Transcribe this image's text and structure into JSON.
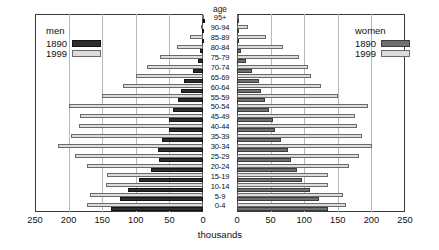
{
  "chart_data": {
    "type": "bar",
    "subtype": "population-pyramid",
    "title": "",
    "xlabel": "thousands",
    "ylabel": "age",
    "axis_title_center": "age",
    "grid": true,
    "xlim_left": [
      250,
      0
    ],
    "xlim_right": [
      0,
      250
    ],
    "xticks": [
      250,
      200,
      150,
      100,
      50,
      0
    ],
    "xticks_right": [
      0,
      50,
      100,
      150,
      200,
      250
    ],
    "categories": [
      "95+",
      "90-94",
      "85-89",
      "80-84",
      "75-79",
      "70-74",
      "65-69",
      "60-64",
      "55-59",
      "50-54",
      "45-49",
      "40-44",
      "35-39",
      "30-34",
      "25-29",
      "20-24",
      "15-19",
      "10-14",
      "5-9",
      "0-4"
    ],
    "series": [
      {
        "name": "men 1890",
        "side": "left",
        "year": "1890",
        "color": "#2e2e2e",
        "values": [
          0,
          1,
          2,
          4,
          7,
          15,
          28,
          32,
          37,
          45,
          50,
          50,
          61,
          67,
          66,
          78,
          95,
          112,
          124,
          137
        ]
      },
      {
        "name": "men 1999",
        "side": "left",
        "year": "1999",
        "color": "#dcdcdc",
        "values": [
          1,
          3,
          19,
          39,
          64,
          84,
          100,
          119,
          151,
          200,
          183,
          185,
          196,
          216,
          190,
          173,
          143,
          144,
          168,
          172
        ]
      },
      {
        "name": "women 1890",
        "side": "right",
        "year": "1890",
        "color": "#6f6f6f",
        "values": [
          1,
          2,
          3,
          6,
          13,
          23,
          32,
          35,
          41,
          48,
          53,
          57,
          66,
          76,
          80,
          89,
          97,
          109,
          122,
          136
        ]
      },
      {
        "name": "women 1999",
        "side": "right",
        "year": "1999",
        "color": "#dcdcdc",
        "values": [
          2,
          17,
          43,
          68,
          93,
          105,
          110,
          125,
          151,
          195,
          176,
          178,
          186,
          201,
          182,
          166,
          136,
          136,
          157,
          162
        ]
      }
    ]
  },
  "legends": {
    "men": {
      "title": "men",
      "rows": [
        {
          "label": "1890",
          "swatch": "dark"
        },
        {
          "label": "1999",
          "swatch": "light"
        }
      ]
    },
    "women": {
      "title": "women",
      "rows": [
        {
          "label": "1890",
          "swatch": "darkw"
        },
        {
          "label": "1999",
          "swatch": "light"
        }
      ]
    }
  },
  "colors": {
    "bar_1890_men": "#2e2e2e",
    "bar_1890_women": "#6f6f6f",
    "bar_1999": "#dcdcdc",
    "grid": "#b8b8b8",
    "frame": "#3a3a3a"
  }
}
